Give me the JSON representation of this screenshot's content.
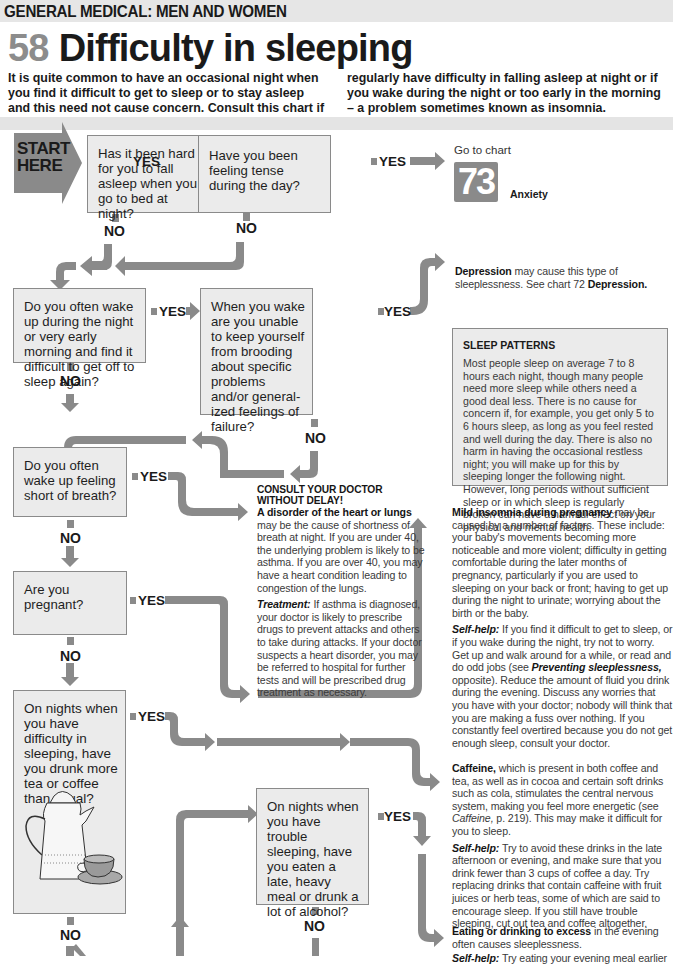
{
  "header": {
    "section": "GENERAL MEDICAL: MEN AND WOMEN",
    "chart_number": "58",
    "title": "Difficulty in sleeping"
  },
  "intro": {
    "left": "It is quite common to have an occasional night when you find it difficult to get to sleep or to stay asleep and this need not cause concern. Consult this chart if you",
    "right": "regularly have difficulty in falling asleep at night or if you wake during the night or too early in the morning – a problem sometimes known as insomnia."
  },
  "start": {
    "line1": "START",
    "line2": "HERE"
  },
  "labels": {
    "yes": "YES",
    "no": "NO"
  },
  "questions": [
    {
      "id": "q1",
      "text": "Has it been hard for you to fall asleep when you go to bed at night?"
    },
    {
      "id": "q2",
      "text": "Have you been feeling tense during the day?"
    },
    {
      "id": "q3",
      "text": "Do you often wake up during the night or very early morning and find it difficult to get off to sleep again?"
    },
    {
      "id": "q4",
      "text": "When you wake are you unable to keep yourself from brooding about specific problems and/or general-ized feelings of failure?"
    },
    {
      "id": "q5",
      "text": "Do you often wake up feeling short of breath?"
    },
    {
      "id": "q6",
      "text": "Are you pregnant?"
    },
    {
      "id": "q7",
      "text": "On nights when you have difficulty in sleeping, have you drunk more tea or coffee than usual?"
    },
    {
      "id": "q8",
      "text": "On nights when you have trouble sleeping, have you eaten a late, heavy meal or drunk a lot of alcohol?"
    }
  ],
  "goto": {
    "prefix": "Go to chart",
    "number": "73",
    "label": "Anxiety"
  },
  "outcomes": {
    "depression": {
      "bold": "Depression",
      "text": " may cause this type of sleeplessness. See chart 72 ",
      "bold2": "Depression."
    },
    "doctor": {
      "urgent1": "CONSULT YOUR DOCTOR",
      "urgent2": "WITHOUT DELAY!",
      "bold": "A disorder of the heart or lungs",
      "text": " may be the cause of shortness of breath at night. If you are under 40, the underlying problem is likely to be asthma. If you are over 40, you may have a heart condition leading to congestion of the lungs.",
      "treatment_label": "Treatment:",
      "treatment": " If asthma is diagnosed, your doctor is likely to prescribe drugs to prevent attacks and others to take during attacks. If your doctor suspects a heart disorder, you may be referred to hospital for further tests and will be prescribed drug treatment as necessary."
    },
    "pregnancy": {
      "bold": "Mild insomnia during pregnancy",
      "text": " may be caused by a number of factors. These include: your baby's movements becoming more noticeable and more violent; difficulty in getting comfortable during the later months of pregnancy, particularly if you are used to sleeping on your back or front; having to get up during the night to urinate; worrying about the birth or the baby.",
      "selfhelp_label": "Self-help:",
      "selfhelp1": " If you find it difficult to get to sleep, or if you wake during the night, try not to worry. Get up and walk around for a while, or read and do odd jobs (see ",
      "selfhelp_ref": "Preventing sleeplessness,",
      "selfhelp2": " opposite). Reduce the amount of fluid you drink during the evening. Discuss any worries that you have with your doctor; nobody will think that you are making a fuss over nothing. If you constantly feel overtired because you do not get enough sleep, consult your doctor."
    },
    "caffeine": {
      "bold": "Caffeine,",
      "text1": " which is present in both coffee and tea, as well as in cocoa and certain soft drinks such as cola, stimulates the central nervous system, making you feel more energetic (see ",
      "ref": "Caffeine,",
      "text2": " p. 219). This may make it difficult for you to sleep.",
      "selfhelp_label": "Self-help:",
      "selfhelp": " Try to avoid these drinks in the late afternoon or evening, and make sure that you drink fewer than 3 cups of coffee a day. Try replacing drinks that contain caffeine with fruit juices or herb teas, some of which are said to encourage sleep. If you still have trouble sleeping, cut out tea and coffee altogether."
    },
    "excess": {
      "bold": "Eating or drinking to excess",
      "text": " in the evening often causes sleeplessness.",
      "selfhelp_label": "Self-help:",
      "selfhelp": " Try eating your evening meal earlier"
    }
  },
  "sidebar": {
    "title": "SLEEP PATTERNS",
    "text": "Most people sleep on average 7 to 8 hours each night, though many people need more sleep while others need a good deal less. There is no cause for concern if, for example, you get only 5 to 6 hours sleep, as long as you feel rested and well during the day. There is also no harm in having the occasional restless night; you will make up for this by sleeping longer the following night. However, long periods without sufficient sleep or in which sleep is regularly broken can have a harmful effect on your physical and mental health."
  },
  "colors": {
    "arrow": "#8a8a8a",
    "box_fill": "#ebebeb",
    "box_border": "#8a8a8a",
    "band": "#e6e6e6",
    "number_grey": "#8c8c8c"
  }
}
